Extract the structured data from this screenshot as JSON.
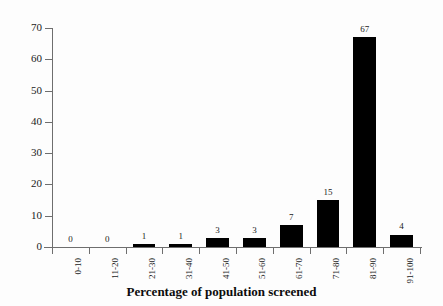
{
  "chart_data": {
    "type": "bar",
    "title": "",
    "subtitle": "",
    "xlabel": "Percentage of population screened",
    "ylabel": "",
    "categories": [
      "0-10",
      "11-20",
      "21-30",
      "31-40",
      "41-50",
      "51-60",
      "61-70",
      "71-80",
      "81-90",
      "91-100"
    ],
    "values": [
      0,
      0,
      1,
      1,
      3,
      3,
      7,
      15,
      67,
      4
    ],
    "data_labels": [
      "0",
      "0",
      "1",
      "1",
      "3",
      "3",
      "7",
      "15",
      "67",
      "4"
    ],
    "ylim": [
      0,
      70
    ],
    "ytick_labels": [
      "0",
      "10",
      "20",
      "30",
      "40",
      "50",
      "60",
      "70"
    ],
    "ytick_values": [
      0,
      10,
      20,
      30,
      40,
      50,
      60,
      70
    ],
    "grid": false,
    "legend": false,
    "legend_position": "none",
    "bar_color": "#000000",
    "axis_color": "#6e6e6e",
    "text_color": "#1a1a1a",
    "background_color": "#fdfdfd"
  }
}
